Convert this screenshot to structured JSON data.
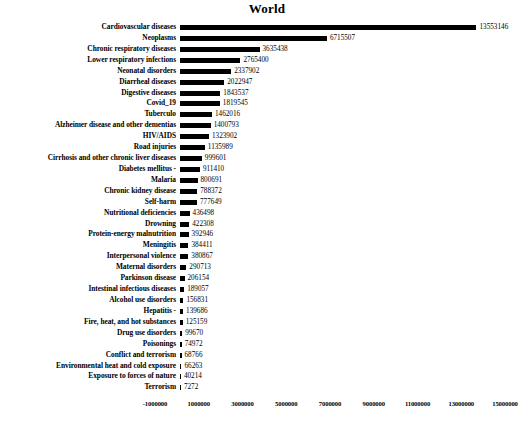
{
  "chart_data": {
    "type": "bar",
    "orientation": "horizontal",
    "title": "World",
    "xlabel": "",
    "ylabel": "",
    "xlim": [
      -1000000,
      15000000
    ],
    "grid": false,
    "legend": "none",
    "bar_color": "#000000",
    "value_labels_shown": true,
    "xticks": [
      -1000000,
      1000000,
      3000000,
      5000000,
      7000000,
      9000000,
      11000000,
      13000000,
      15000000
    ],
    "xtick_labels": [
      "-1000000",
      "1000000",
      "3000000",
      "5000000",
      "7000000",
      "9000000",
      "11000000",
      "13000000",
      "15000000"
    ],
    "categories": [
      "Cardiovascular diseases",
      "Neoplasms",
      "Chronic respiratory diseases",
      "Lower respiratory infections",
      "Neonatal disorders",
      "Diarrheal diseases",
      "Digestive diseases",
      "Covid_19",
      "Tuberculo",
      "Alzheimer disease and other dementias",
      "HIV/AIDS",
      "Road injuries",
      "Cirrhosis and other chronic liver diseases",
      "Diabetes mellitus -",
      "Malaria",
      "Chronic kidney disease",
      "Self-harm",
      "Nutritional deficiencies",
      "Drowning",
      "Protein-energy malnutrition",
      "Meningitis",
      "Interpersonal violence",
      "Maternal disorders",
      "Parkinson disease",
      "Intestinal infectious diseases",
      "Alcohol use disorders",
      "Hepatitis -",
      "Fire, heat, and hot substances",
      "Drug use disorders",
      "Poisonings",
      "Conflict and terrorism",
      "Environmental heat and cold exposure",
      "Exposure to forces of nature",
      "Terrorism"
    ],
    "values": [
      13553146,
      6715507,
      3635438,
      2765400,
      2337902,
      2022947,
      1843537,
      1819545,
      1462016,
      1400793,
      1323902,
      1135989,
      999601,
      911410,
      800691,
      788372,
      777649,
      436498,
      422308,
      392946,
      384411,
      380867,
      290713,
      206154,
      189057,
      156831,
      139686,
      125159,
      99670,
      74972,
      68766,
      66263,
      40214,
      7272
    ],
    "value_labels": [
      "13553146",
      "6715507",
      "3635438",
      "2765400",
      "2337902",
      "2022947",
      "1843537",
      "1819545",
      "1462016",
      "1400793",
      "1323902",
      "1135989",
      "999601",
      "911410",
      "800691",
      "788372",
      "777649",
      "436498",
      "422308",
      "392946",
      "384411",
      "380867",
      "290713",
      "206154",
      "189057",
      "156831",
      "139686",
      "125159",
      "99670",
      "74972",
      "68766",
      "66263",
      "40214",
      "7272"
    ]
  }
}
